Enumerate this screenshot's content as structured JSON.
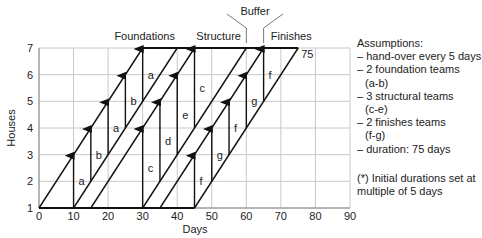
{
  "chart_data": {
    "type": "line-of-balance",
    "title": "",
    "xlabel": "Days",
    "ylabel": "Houses",
    "xlim": [
      0,
      90
    ],
    "ylim": [
      1,
      7
    ],
    "xticks": [
      "0",
      "10",
      "20",
      "30",
      "40",
      "50",
      "60",
      "70",
      "80",
      "90"
    ],
    "yticks": [
      "1",
      "2",
      "3",
      "4",
      "5",
      "6",
      "7"
    ],
    "grid": true,
    "phases": [
      {
        "name": "Foundations",
        "start_lines": [
          [
            0,
            1,
            30,
            7
          ]
        ],
        "end_lines": [
          [
            10,
            1,
            40,
            7
          ],
          [
            15,
            1,
            45,
            7
          ]
        ]
      },
      {
        "name": "Structure",
        "start_lines": [
          [
            15,
            1,
            45,
            7
          ]
        ],
        "end_lines": [
          [
            30,
            1,
            60,
            7
          ]
        ]
      },
      {
        "name": "Finishes",
        "start_lines": [
          [
            35,
            1,
            65,
            7
          ]
        ],
        "end_lines": [
          [
            45,
            1,
            75,
            7
          ]
        ]
      }
    ],
    "diagonals": [
      {
        "x0": 0,
        "y0": 1,
        "x1": 30,
        "y1": 7
      },
      {
        "x0": 10,
        "y0": 1,
        "x1": 40,
        "y1": 7
      },
      {
        "x0": 15,
        "y0": 1,
        "x1": 45,
        "y1": 7
      },
      {
        "x0": 30,
        "y0": 1,
        "x1": 60,
        "y1": 7
      },
      {
        "x0": 35,
        "y0": 1,
        "x1": 65,
        "y1": 7
      },
      {
        "x0": 45,
        "y0": 1,
        "x1": 75,
        "y1": 7
      }
    ],
    "baseline": {
      "x0": 0,
      "x1": 45,
      "y": 1
    },
    "topline": {
      "x0": 30,
      "x1": 75,
      "y": 7
    },
    "team_arrows": [
      {
        "team": "a",
        "x": 10,
        "y0": 1,
        "y1": 3
      },
      {
        "team": "b",
        "x": 15,
        "y0": 2,
        "y1": 4
      },
      {
        "team": "a",
        "x": 20,
        "y0": 3,
        "y1": 5
      },
      {
        "team": "b",
        "x": 25,
        "y0": 4,
        "y1": 6
      },
      {
        "team": "a",
        "x": 30,
        "y0": 5,
        "y1": 7
      },
      {
        "team": "c",
        "x": 30,
        "y0": 1,
        "y1": 4
      },
      {
        "team": "d",
        "x": 35,
        "y0": 2,
        "y1": 5
      },
      {
        "team": "e",
        "x": 40,
        "y0": 3,
        "y1": 6
      },
      {
        "team": "c",
        "x": 45,
        "y0": 4,
        "y1": 7
      },
      {
        "team": "f",
        "x": 45,
        "y0": 1,
        "y1": 3
      },
      {
        "team": "g",
        "x": 50,
        "y0": 2,
        "y1": 4
      },
      {
        "team": "f",
        "x": 55,
        "y0": 3,
        "y1": 5
      },
      {
        "team": "g",
        "x": 60,
        "y0": 4,
        "y1": 6
      },
      {
        "team": "f",
        "x": 65,
        "y0": 5,
        "y1": 7
      }
    ],
    "annotations": {
      "phase_labels": [
        {
          "text": "Foundations",
          "x": 30
        },
        {
          "text": "Structure",
          "x": 52
        },
        {
          "text": "Finishes",
          "x": 73
        }
      ],
      "buffer": {
        "text": "Buffer",
        "from_x": 60,
        "to_x": 65
      },
      "end_value": {
        "text": "75",
        "x": 75,
        "y": 7
      }
    }
  },
  "notes": {
    "title": "Assumptions:",
    "items": [
      {
        "text": "– hand-over every 5 days"
      },
      {
        "text": "– 2 foundation teams",
        "sub": "(a-b)"
      },
      {
        "text": "– 3 structural teams",
        "sub": "(c-e)"
      },
      {
        "text": "– 2 finishes teams",
        "sub": "(f-g)"
      },
      {
        "text": "– duration: 75 days"
      }
    ],
    "footnote_line1": "(*) Initial durations set at",
    "footnote_line2": "multiple of 5 days"
  }
}
